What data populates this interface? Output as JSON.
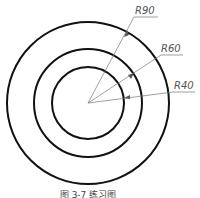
{
  "figure": {
    "center": [
      88,
      103
    ],
    "circles": [
      {
        "label": "R90",
        "r_px": 81
      },
      {
        "label": "R60",
        "r_px": 54
      },
      {
        "label": "R40",
        "r_px": 36
      }
    ],
    "leaders": [
      {
        "label": "R90",
        "text_x": 133,
        "text_y": 14,
        "line_end_x": 158,
        "line_end_y": 16
      },
      {
        "label": "R60",
        "text_x": 161,
        "text_y": 52,
        "line_end_x": 182,
        "line_end_y": 54
      },
      {
        "label": "R40",
        "text_x": 173,
        "text_y": 89,
        "line_end_x": 194,
        "line_end_y": 91
      }
    ],
    "caption": "图 3-7  练习图",
    "stroke_color": "#111111",
    "leader_color": "#666666"
  }
}
